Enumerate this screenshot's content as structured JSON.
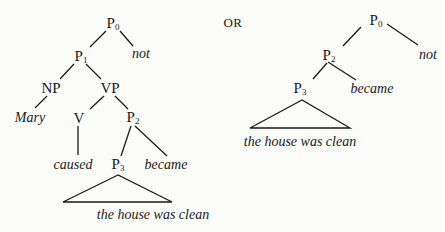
{
  "diagram": {
    "type": "syntax-tree-comparison",
    "separator": "OR",
    "left_tree": {
      "nodes": {
        "p0": {
          "base": "P",
          "sub": "0"
        },
        "not": "not",
        "p1": {
          "base": "P",
          "sub": "1"
        },
        "np": "NP",
        "vp": "VP",
        "mary": "Mary",
        "v": "V",
        "p2": {
          "base": "P",
          "sub": "2"
        },
        "caused": "caused",
        "p3": {
          "base": "P",
          "sub": "3"
        },
        "became": "became",
        "clause": "the house was clean"
      },
      "edges": [
        [
          "P0",
          "P1"
        ],
        [
          "P0",
          "not"
        ],
        [
          "P1",
          "NP"
        ],
        [
          "P1",
          "VP"
        ],
        [
          "NP",
          "Mary"
        ],
        [
          "VP",
          "V"
        ],
        [
          "VP",
          "P2"
        ],
        [
          "V",
          "caused"
        ],
        [
          "P2",
          "P3"
        ],
        [
          "P2",
          "became"
        ],
        [
          "P3",
          "triangle: the house was clean"
        ]
      ]
    },
    "right_tree": {
      "nodes": {
        "p0": {
          "base": "P",
          "sub": "0"
        },
        "not": "not",
        "p2": {
          "base": "P",
          "sub": "2"
        },
        "became": "became",
        "p3": {
          "base": "P",
          "sub": "3"
        },
        "clause": "the house was clean"
      },
      "edges": [
        [
          "P0",
          "P2"
        ],
        [
          "P0",
          "not"
        ],
        [
          "P2",
          "P3"
        ],
        [
          "P2",
          "became"
        ],
        [
          "P3",
          "triangle: the house was clean"
        ]
      ]
    }
  }
}
